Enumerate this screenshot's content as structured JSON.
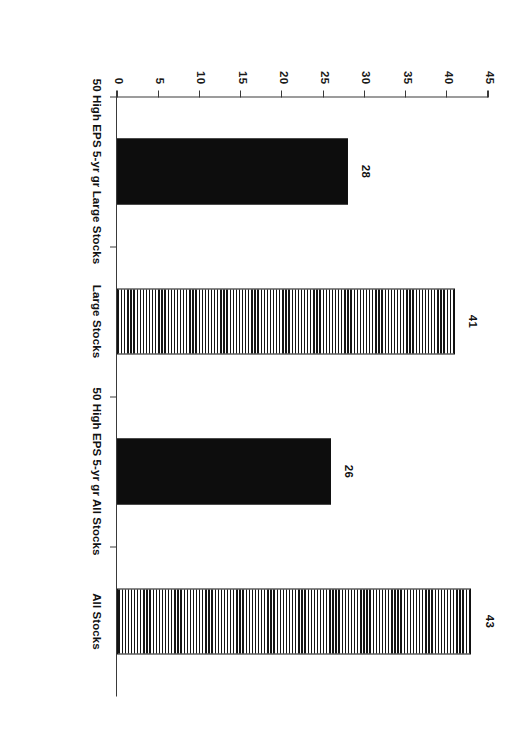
{
  "chart_data": {
    "type": "bar",
    "title": "",
    "subtitle": "",
    "xlabel": "",
    "ylabel": "",
    "orientation": "vertical-rotated-90",
    "grid": false,
    "legend": "none",
    "categories": [
      "50 High EPS 5-yr gr Large Stocks",
      "Large Stocks",
      "50 High EPS 5-yr gr All Stocks",
      "All Stocks"
    ],
    "values": [
      28,
      41,
      26,
      43
    ],
    "value_labels": [
      "28",
      "41",
      "26",
      "43"
    ],
    "bar_styles": [
      "solid-black",
      "vertical-stripes",
      "solid-black",
      "vertical-stripes"
    ],
    "ylim": [
      0,
      45
    ],
    "yticks": [
      0,
      5,
      10,
      15,
      20,
      25,
      30,
      35,
      40,
      45
    ],
    "ytick_labels": [
      "0",
      "5",
      "10",
      "15",
      "20",
      "25",
      "30",
      "35",
      "40",
      "45"
    ]
  },
  "caption": {
    "text": ""
  },
  "colors": {
    "bar_solid": "#0d0d0d",
    "bar_stripe": "#141414",
    "axis": "#3a3a3a",
    "text": "#111111",
    "background": "#ffffff"
  }
}
